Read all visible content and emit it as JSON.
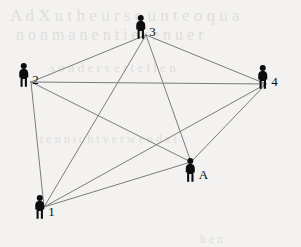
{
  "diagram": {
    "type": "network-graph",
    "canvas": {
      "width": 301,
      "height": 247
    },
    "background_color": "#f3f2f0",
    "edge_color": "#7b7b79",
    "edge_width": 1,
    "node_color": "#0d0d0d",
    "label_color": "#0d0d0d",
    "nodes": [
      {
        "id": "1",
        "label": "1",
        "x": 44,
        "y": 207,
        "icon": "person-icon"
      },
      {
        "id": "2",
        "label": "2",
        "x": 28,
        "y": 75,
        "icon": "person-icon"
      },
      {
        "id": "3",
        "label": "3",
        "x": 145,
        "y": 27,
        "icon": "person-icon"
      },
      {
        "id": "4",
        "label": "4",
        "x": 267,
        "y": 77,
        "icon": "person-icon"
      },
      {
        "id": "A",
        "label": "A",
        "x": 196,
        "y": 170,
        "icon": "person-icon"
      }
    ],
    "edges": [
      {
        "from": "1",
        "to": "2"
      },
      {
        "from": "1",
        "to": "3"
      },
      {
        "from": "1",
        "to": "4"
      },
      {
        "from": "1",
        "to": "A"
      },
      {
        "from": "2",
        "to": "3"
      },
      {
        "from": "2",
        "to": "4"
      },
      {
        "from": "2",
        "to": "A"
      },
      {
        "from": "3",
        "to": "4"
      },
      {
        "from": "3",
        "to": "A"
      },
      {
        "from": "4",
        "to": "A"
      }
    ],
    "background_bleed_text": [
      {
        "text": "A  d  X  u  t  h  e  u  r  s  o  u  n  t  e  o  q  u  a",
        "x": 10,
        "y": 6,
        "size": 17
      },
      {
        "text": "n  o  n  m  a  n  e  n  t  i  e  r    e  n  u  e  r",
        "x": 16,
        "y": 26,
        "size": 16
      },
      {
        "text": "s  o  n  d  e  r    v  e  r  t  e  i  l  e  n",
        "x": 50,
        "y": 60,
        "size": 13
      },
      {
        "text": "t  e  n    n  i  c  h  t    v  e  r  w  e  n  d  e  t",
        "x": 40,
        "y": 132,
        "size": 12
      },
      {
        "text": "h  e  n",
        "x": 200,
        "y": 232,
        "size": 12
      }
    ]
  }
}
